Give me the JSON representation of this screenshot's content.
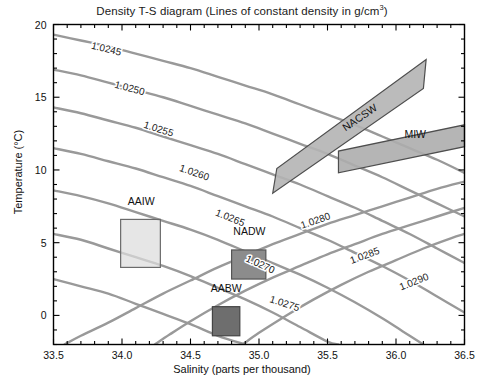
{
  "chart_data": {
    "type": "line",
    "title": "Density T-S diagram (Lines of constant density in g/cm",
    "title_sup": "3",
    "title_tail": ")",
    "xlabel": "Salinity (parts per thousand)",
    "ylabel": "Temperature (°C)",
    "xlim": [
      33.5,
      36.5
    ],
    "ylim": [
      -2,
      20
    ],
    "xticks": [
      "33.5",
      "34.0",
      "34.5",
      "35.0",
      "35.5",
      "36.0",
      "36.5"
    ],
    "xtick_values": [
      33.5,
      34.0,
      34.5,
      35.0,
      35.5,
      36.0,
      36.5
    ],
    "x_minor_step": 0.1,
    "yticks": [
      "20",
      "15",
      "10",
      "5",
      "0"
    ],
    "ytick_values": [
      20,
      15,
      10,
      5,
      0
    ],
    "y_minor_step": 1,
    "grid": false,
    "legend": "none",
    "contour_color": "#999999",
    "contour_label_color": "#1b1b1b",
    "contours": [
      {
        "label": "1.0245",
        "value": 1.0245,
        "points": [
          [
            33.5,
            19.3
          ],
          [
            33.7,
            18.9
          ],
          [
            33.9,
            18.5
          ],
          [
            34.1,
            18.0
          ],
          [
            34.3,
            17.5
          ],
          [
            34.5,
            17.0
          ],
          [
            34.7,
            16.4
          ],
          [
            34.9,
            15.8
          ],
          [
            35.1,
            15.2
          ],
          [
            35.3,
            14.5
          ],
          [
            35.5,
            13.8
          ],
          [
            35.7,
            13.1
          ],
          [
            35.9,
            12.3
          ],
          [
            36.1,
            11.5
          ],
          [
            36.3,
            10.7
          ],
          [
            36.5,
            9.8
          ]
        ],
        "label_pos": [
          33.88,
          18.1
        ]
      },
      {
        "label": "1.0250",
        "value": 1.025,
        "points": [
          [
            33.5,
            16.9
          ],
          [
            33.7,
            16.5
          ],
          [
            33.9,
            16.0
          ],
          [
            34.1,
            15.5
          ],
          [
            34.3,
            15.0
          ],
          [
            34.5,
            14.4
          ],
          [
            34.7,
            13.8
          ],
          [
            34.9,
            13.2
          ],
          [
            35.1,
            12.5
          ],
          [
            35.3,
            11.8
          ],
          [
            35.5,
            11.1
          ],
          [
            35.7,
            10.3
          ],
          [
            35.9,
            9.5
          ],
          [
            36.1,
            8.6
          ],
          [
            36.3,
            7.7
          ],
          [
            36.5,
            6.8
          ]
        ],
        "label_pos": [
          34.05,
          15.4
        ]
      },
      {
        "label": "1.0255",
        "value": 1.0255,
        "points": [
          [
            33.5,
            14.3
          ],
          [
            33.7,
            13.9
          ],
          [
            33.9,
            13.4
          ],
          [
            34.1,
            12.9
          ],
          [
            34.3,
            12.3
          ],
          [
            34.5,
            11.7
          ],
          [
            34.7,
            11.1
          ],
          [
            34.9,
            10.4
          ],
          [
            35.1,
            9.7
          ],
          [
            35.3,
            9.0
          ],
          [
            35.5,
            8.2
          ],
          [
            35.7,
            7.4
          ],
          [
            35.9,
            6.5
          ],
          [
            36.1,
            5.6
          ],
          [
            36.3,
            4.6
          ],
          [
            36.5,
            3.6
          ]
        ],
        "label_pos": [
          34.26,
          12.6
        ]
      },
      {
        "label": "1.0260",
        "value": 1.026,
        "points": [
          [
            33.5,
            11.5
          ],
          [
            33.7,
            11.1
          ],
          [
            33.9,
            10.6
          ],
          [
            34.1,
            10.1
          ],
          [
            34.3,
            9.5
          ],
          [
            34.5,
            8.9
          ],
          [
            34.7,
            8.2
          ],
          [
            34.9,
            7.5
          ],
          [
            35.1,
            6.8
          ],
          [
            35.3,
            6.0
          ],
          [
            35.5,
            5.2
          ],
          [
            35.7,
            4.3
          ],
          [
            35.9,
            3.4
          ],
          [
            36.1,
            2.4
          ],
          [
            36.3,
            1.3
          ],
          [
            36.5,
            0.2
          ]
        ],
        "label_pos": [
          34.52,
          9.6
        ]
      },
      {
        "label": "1.0265",
        "value": 1.0265,
        "points": [
          [
            33.5,
            8.6
          ],
          [
            33.7,
            8.2
          ],
          [
            33.9,
            7.7
          ],
          [
            34.1,
            7.1
          ],
          [
            34.3,
            6.5
          ],
          [
            34.5,
            5.9
          ],
          [
            34.7,
            5.2
          ],
          [
            34.9,
            4.4
          ],
          [
            35.1,
            3.6
          ],
          [
            35.3,
            2.8
          ],
          [
            35.5,
            1.9
          ],
          [
            35.7,
            0.9
          ],
          [
            35.9,
            -0.2
          ],
          [
            36.05,
            -1.1
          ],
          [
            36.2,
            -2.0
          ]
        ],
        "label_pos": [
          34.78,
          6.5
        ]
      },
      {
        "label": "1.0270",
        "value": 1.027,
        "points": [
          [
            33.5,
            5.6
          ],
          [
            33.7,
            5.2
          ],
          [
            33.9,
            4.6
          ],
          [
            34.1,
            4.0
          ],
          [
            34.3,
            3.4
          ],
          [
            34.5,
            2.7
          ],
          [
            34.7,
            1.9
          ],
          [
            34.9,
            1.1
          ],
          [
            35.1,
            0.2
          ],
          [
            35.3,
            -0.8
          ],
          [
            35.5,
            -1.8
          ],
          [
            35.58,
            -2.0
          ]
        ],
        "label_pos": [
          35.0,
          3.3
        ]
      },
      {
        "label": "1.0275",
        "value": 1.0275,
        "points": [
          [
            33.5,
            2.5
          ],
          [
            33.7,
            2.0
          ],
          [
            33.9,
            1.5
          ],
          [
            34.1,
            0.8
          ],
          [
            34.3,
            0.1
          ],
          [
            34.5,
            -0.6
          ],
          [
            34.7,
            -1.4
          ],
          [
            34.9,
            -2.0
          ]
        ],
        "label_pos": [
          35.18,
          0.6
        ]
      },
      {
        "label": "1.0280",
        "value": 1.028,
        "points": [
          [
            33.58,
            -2.0
          ],
          [
            33.7,
            -1.4
          ],
          [
            33.9,
            -0.5
          ],
          [
            34.1,
            0.5
          ],
          [
            34.3,
            1.5
          ],
          [
            34.5,
            2.4
          ],
          [
            34.7,
            3.3
          ],
          [
            34.9,
            4.1
          ],
          [
            35.1,
            4.9
          ],
          [
            35.3,
            5.6
          ],
          [
            35.5,
            6.3
          ],
          [
            35.7,
            6.9
          ],
          [
            35.9,
            7.5
          ],
          [
            36.1,
            8.1
          ],
          [
            36.3,
            8.7
          ],
          [
            36.5,
            9.2
          ]
        ],
        "label_pos": [
          35.42,
          6.3
        ]
      },
      {
        "label": "1.0285",
        "value": 1.0285,
        "points": [
          [
            34.24,
            -2.0
          ],
          [
            34.35,
            -1.3
          ],
          [
            34.5,
            -0.4
          ],
          [
            34.7,
            0.7
          ],
          [
            34.9,
            1.7
          ],
          [
            35.1,
            2.6
          ],
          [
            35.3,
            3.4
          ],
          [
            35.5,
            4.2
          ],
          [
            35.7,
            4.9
          ],
          [
            35.9,
            5.6
          ],
          [
            36.1,
            6.2
          ],
          [
            36.3,
            6.8
          ],
          [
            36.5,
            7.4
          ]
        ],
        "label_pos": [
          35.78,
          3.9
        ]
      },
      {
        "label": "1.0290",
        "value": 1.029,
        "points": [
          [
            34.88,
            -2.0
          ],
          [
            35.0,
            -1.2
          ],
          [
            35.2,
            0.0
          ],
          [
            35.4,
            1.1
          ],
          [
            35.6,
            2.1
          ],
          [
            35.8,
            3.0
          ],
          [
            36.0,
            3.8
          ],
          [
            36.2,
            4.6
          ],
          [
            36.4,
            5.3
          ],
          [
            36.5,
            5.6
          ]
        ],
        "label_pos": [
          36.14,
          2.1
        ]
      }
    ],
    "water_masses": [
      {
        "name": "AAIW",
        "shape": "rect",
        "fill": "#dcdcdc",
        "stroke": "#6b6b6b",
        "salinity_range": [
          33.99,
          34.28
        ],
        "temperature_range": [
          3.3,
          6.6
        ],
        "label_pos": [
          34.14,
          7.6
        ]
      },
      {
        "name": "NADW",
        "shape": "rect",
        "fill": "#8c8c8c",
        "stroke": "#555555",
        "salinity_range": [
          34.8,
          35.05
        ],
        "temperature_range": [
          2.5,
          4.5
        ],
        "label_pos": [
          34.93,
          5.5
        ]
      },
      {
        "name": "AABW",
        "shape": "rect",
        "fill": "#6e6e6e",
        "stroke": "#444444",
        "salinity_range": [
          34.66,
          34.86
        ],
        "temperature_range": [
          -1.4,
          0.6
        ],
        "label_pos": [
          34.76,
          1.6
        ]
      },
      {
        "name": "NACSW",
        "shape": "parallelogram",
        "fill": "#b4b4b4",
        "stroke": "#4e4e4e",
        "vertices": [
          [
            35.1,
            8.4
          ],
          [
            35.13,
            10.1
          ],
          [
            36.22,
            17.6
          ],
          [
            36.2,
            15.6
          ]
        ],
        "label_pos": [
          35.75,
          13.4
        ],
        "label_rotation": -34
      },
      {
        "name": "MIW",
        "shape": "parallelogram",
        "fill": "#adadad",
        "stroke": "#4e4e4e",
        "vertices": [
          [
            35.58,
            9.8
          ],
          [
            35.58,
            11.3
          ],
          [
            36.5,
            13.1
          ],
          [
            36.5,
            11.6
          ]
        ],
        "label_pos": [
          36.14,
          12.2
        ],
        "label_rotation": 0
      }
    ]
  }
}
